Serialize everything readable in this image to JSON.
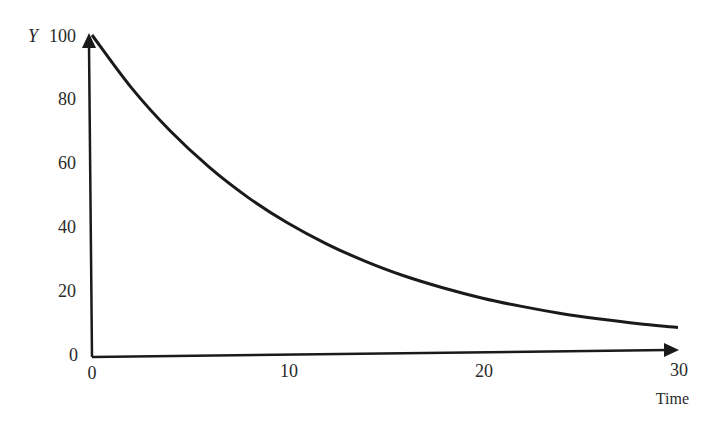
{
  "chart_data": {
    "type": "line",
    "title": "",
    "xlabel": "Time",
    "ylabel": "Y",
    "xlim": [
      0,
      30
    ],
    "ylim": [
      0,
      100
    ],
    "grid": false,
    "legend": null,
    "x_ticks": [
      "0",
      "10",
      "20",
      "30"
    ],
    "y_ticks": [
      "0",
      "20",
      "40",
      "60",
      "80",
      "100"
    ],
    "x": [
      0,
      2,
      4,
      6,
      8,
      10,
      12,
      14,
      16,
      18,
      20,
      22,
      24,
      26,
      28,
      30
    ],
    "series": [
      {
        "name": "Y",
        "values": [
          100,
          83.5,
          69.8,
          58.3,
          48.7,
          40.7,
          34.0,
          28.4,
          23.7,
          19.8,
          16.5,
          13.8,
          11.5,
          9.6,
          8.0,
          6.7
        ]
      }
    ],
    "annotations": [
      "exponential decay curve starting at Y=100"
    ]
  },
  "labels": {
    "y_axis": "Y",
    "x_axis": "Time",
    "x_ticks": [
      "0",
      "10",
      "20",
      "30"
    ],
    "y_ticks": [
      "0",
      "20",
      "40",
      "60",
      "80",
      "100"
    ]
  },
  "colors": {
    "line": "#1a1a1a",
    "axis": "#1a1a1a",
    "text": "#2a2a2a"
  }
}
